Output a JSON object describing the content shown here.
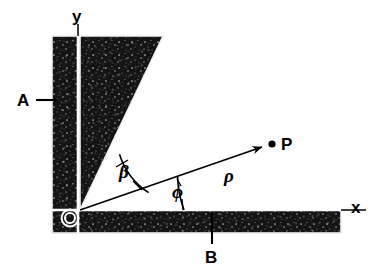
{
  "figure": {
    "kind": "physics-geometry-diagram",
    "background_color": "#ffffff",
    "ink_color": "#000000",
    "fill_color": "#141414",
    "outline_color": "#e8e8e8"
  },
  "axes": {
    "y_label": "y",
    "x_label": "x",
    "origin_marker_name": "origin"
  },
  "labels": {
    "plate_a": "A",
    "plate_b": "B",
    "point_p": "P",
    "radius": "ρ",
    "angle_phi": "ϕ",
    "angle_beta": "β"
  },
  "geometry": {
    "origin": {
      "x": 80,
      "y": 210
    },
    "vertical_bar": {
      "x": 52,
      "y": 36,
      "width": 28,
      "height": 197
    },
    "horizontal_bar": {
      "x": 52,
      "y": 210,
      "width": 289,
      "height": 23
    },
    "wedge_points": "80,210 80,36 163,36",
    "y_axis": {
      "x": 78,
      "y_top": 24,
      "y_bottom": 233
    },
    "x_axis": {
      "y": 210,
      "x_left": 52,
      "x_right": 366
    },
    "rho_ray": {
      "x1": 80,
      "y1": 210,
      "x2": 266,
      "y2": 146
    },
    "point_p_dot": {
      "x": 272,
      "y": 144,
      "r": 3.6
    },
    "beta_arc_radius": 72,
    "phi_arc_radius": 104
  }
}
